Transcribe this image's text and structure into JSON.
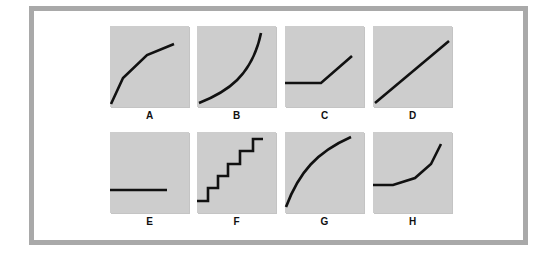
{
  "figure": {
    "colors": {
      "frame_border": "#a9a9a9",
      "panel_background": "#cdcdcd",
      "curve": "#111111",
      "label": "#111111"
    },
    "panels": [
      {
        "id": "A",
        "label": "A",
        "shape": "piecewise concave rising",
        "path": "M1,78 L13,52 L37,29 L64,18"
      },
      {
        "id": "B",
        "label": "B",
        "shape": "convex rising curve (accelerating)",
        "path": "M2,77 C30,66 55,50 64,7"
      },
      {
        "id": "C",
        "label": "C",
        "shape": "flat then linear rise",
        "path": "M0,57 L36,57 L67,30"
      },
      {
        "id": "D",
        "label": "D",
        "shape": "straight linear rise",
        "path": "M2,77 L76,15"
      },
      {
        "id": "E",
        "label": "E",
        "shape": "flat horizontal line",
        "path": "M0,58 L57,58"
      },
      {
        "id": "F",
        "label": "F",
        "shape": "staircase step function",
        "path": "M0,69 L11,69 L11,56 L21,56 L21,44 L31,44 L31,32 L43,32 L43,19 L56,19 L56,7 L66,7"
      },
      {
        "id": "G",
        "label": "G",
        "shape": "concave rising curve (decelerating)",
        "path": "M1,75 C14,40 32,20 66,5"
      },
      {
        "id": "H",
        "label": "H",
        "shape": "flat then accelerating rise",
        "path": "M0,53 L20,53 L42,46 L58,32 L68,12"
      }
    ]
  }
}
